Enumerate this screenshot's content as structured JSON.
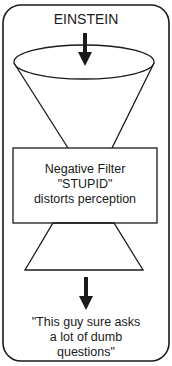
{
  "diagram": {
    "input_label": "EINSTEIN",
    "filter": {
      "line1": "Negative Filter",
      "line2": "\"STUPID\"",
      "line3": "distorts perception"
    },
    "output": {
      "line1": "\"This guy sure asks",
      "line2": "a lot of dumb",
      "line3": "questions\""
    },
    "colors": {
      "stroke": "#1a1a1a",
      "background": "#ffffff"
    }
  }
}
